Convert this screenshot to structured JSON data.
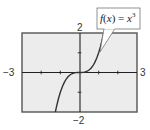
{
  "chart_data": {
    "type": "line",
    "title": "",
    "function": "f(x) = x^3",
    "label": {
      "prefix": "f",
      "open": "(",
      "var": "x",
      "close": ")",
      "eq": " = ",
      "base": "x",
      "exp": "3"
    },
    "xlim": [
      -3,
      3
    ],
    "ylim": [
      -2,
      2
    ],
    "xlabel": "",
    "ylabel": "",
    "tick_labels": {
      "xmin": "−3",
      "xmax": "3",
      "ymin": "−2",
      "ymax": "2"
    },
    "x_ticks": [
      -2,
      -1,
      1,
      2
    ],
    "y_ticks": [
      -1,
      1
    ],
    "grid": false,
    "series": [
      {
        "name": "f(x) = x^3",
        "x": [
          -1.26,
          -1.2,
          -1.1,
          -1.0,
          -0.9,
          -0.8,
          -0.7,
          -0.6,
          -0.5,
          -0.4,
          -0.3,
          -0.2,
          -0.1,
          0.0,
          0.1,
          0.2,
          0.3,
          0.4,
          0.5,
          0.6,
          0.7,
          0.8,
          0.9,
          1.0,
          1.1,
          1.2,
          1.26
        ],
        "y": [
          -2.0,
          -1.728,
          -1.331,
          -1.0,
          -0.729,
          -0.512,
          -0.343,
          -0.216,
          -0.125,
          -0.064,
          -0.027,
          -0.008,
          -0.001,
          0.0,
          0.001,
          0.008,
          0.027,
          0.064,
          0.125,
          0.216,
          0.343,
          0.512,
          0.729,
          1.0,
          1.331,
          1.728,
          2.0
        ]
      }
    ],
    "colors": {
      "background": "#ececec",
      "frame": "#555555",
      "curve": "#333333",
      "axis": "#222222"
    }
  }
}
